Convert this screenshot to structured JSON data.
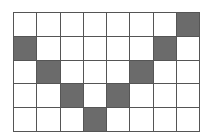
{
  "grid": {
    "rows": 5,
    "cols": 8,
    "fill_color": "#6b6b6b",
    "empty_color": "#ffffff",
    "line_color": "#555555",
    "filled_cells": [
      {
        "row": 0,
        "col": 7
      },
      {
        "row": 1,
        "col": 0
      },
      {
        "row": 1,
        "col": 6
      },
      {
        "row": 2,
        "col": 1
      },
      {
        "row": 2,
        "col": 5
      },
      {
        "row": 3,
        "col": 2
      },
      {
        "row": 3,
        "col": 4
      },
      {
        "row": 4,
        "col": 3
      }
    ]
  }
}
